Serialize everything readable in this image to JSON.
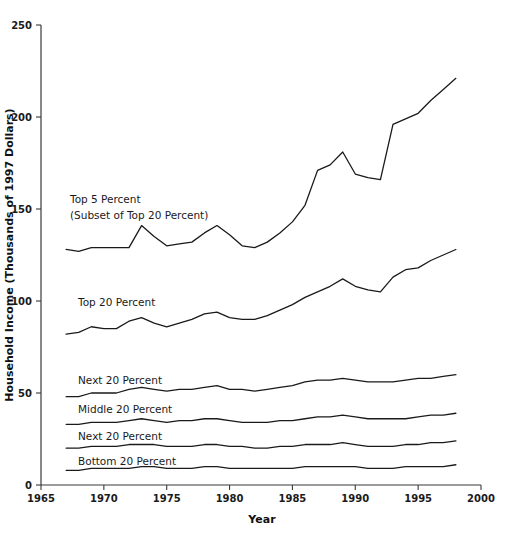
{
  "chart_data": {
    "type": "line",
    "title": "",
    "xlabel": "Year",
    "ylabel": "Household Income (Thousands of 1997 Dollars)",
    "xlim": [
      1965,
      2000
    ],
    "ylim": [
      0,
      250
    ],
    "xticks": [
      1965,
      1970,
      1975,
      1980,
      1985,
      1990,
      1995,
      2000
    ],
    "yticks": [
      0,
      50,
      100,
      150,
      200,
      250
    ],
    "grid": false,
    "legend_position": "inline-labels",
    "x": [
      1967,
      1968,
      1969,
      1970,
      1971,
      1972,
      1973,
      1974,
      1975,
      1976,
      1977,
      1978,
      1979,
      1980,
      1981,
      1982,
      1983,
      1984,
      1985,
      1986,
      1987,
      1988,
      1989,
      1990,
      1991,
      1992,
      1993,
      1994,
      1995,
      1996,
      1997,
      1998
    ],
    "series": [
      {
        "name": "Top 5 Percent",
        "label": "Top 5 Percent",
        "sublabel": "(Subset of Top 20 Percent)",
        "values": [
          128,
          127,
          129,
          129,
          129,
          129,
          141,
          135,
          130,
          131,
          132,
          137,
          141,
          136,
          130,
          129,
          132,
          137,
          143,
          152,
          171,
          174,
          181,
          169,
          167,
          166,
          196,
          199,
          202,
          209,
          215,
          221
        ]
      },
      {
        "name": "Top 20 Percent",
        "label": "Top 20 Percent",
        "values": [
          82,
          83,
          86,
          85,
          85,
          89,
          91,
          88,
          86,
          88,
          90,
          93,
          94,
          91,
          90,
          90,
          92,
          95,
          98,
          102,
          105,
          108,
          112,
          108,
          106,
          105,
          113,
          117,
          118,
          122,
          125,
          128
        ]
      },
      {
        "name": "Next 20 Percent",
        "label": "Next 20 Percent",
        "values": [
          48,
          48,
          50,
          50,
          50,
          52,
          53,
          52,
          51,
          52,
          52,
          53,
          54,
          52,
          52,
          51,
          52,
          53,
          54,
          56,
          57,
          57,
          58,
          57,
          56,
          56,
          56,
          57,
          58,
          58,
          59,
          60
        ]
      },
      {
        "name": "Middle 20 Percent",
        "label": "Middle 20 Percent",
        "values": [
          33,
          33,
          34,
          34,
          34,
          35,
          36,
          35,
          34,
          35,
          35,
          36,
          36,
          35,
          34,
          34,
          34,
          35,
          35,
          36,
          37,
          37,
          38,
          37,
          36,
          36,
          36,
          36,
          37,
          38,
          38,
          39
        ]
      },
      {
        "name": "Next 20 Percent (Second Quintile)",
        "label": "Next 20 Percent",
        "values": [
          20,
          20,
          21,
          21,
          21,
          22,
          22,
          22,
          21,
          21,
          21,
          22,
          22,
          21,
          21,
          20,
          20,
          21,
          21,
          22,
          22,
          22,
          23,
          22,
          21,
          21,
          21,
          22,
          22,
          23,
          23,
          24
        ]
      },
      {
        "name": "Bottom 20 Percent",
        "label": "Bottom 20 Percent",
        "values": [
          8,
          8,
          9,
          9,
          9,
          9,
          10,
          10,
          9,
          9,
          9,
          10,
          10,
          9,
          9,
          9,
          9,
          9,
          9,
          10,
          10,
          10,
          10,
          10,
          9,
          9,
          9,
          10,
          10,
          10,
          10,
          11
        ]
      }
    ],
    "annotations": [
      {
        "name": "top5-label",
        "text": "Top 5 Percent",
        "x": 70,
        "y": 203
      },
      {
        "name": "top5-sublabel",
        "text": "(Subset of Top 20 Percent)",
        "x": 70,
        "y": 219
      },
      {
        "name": "top20-label",
        "text": "Top 20 Percent",
        "x": 78,
        "y": 306
      },
      {
        "name": "next20-label",
        "text": "Next 20 Percent",
        "x": 78,
        "y": 384
      },
      {
        "name": "middle20-label",
        "text": "Middle 20 Percent",
        "x": 78,
        "y": 413
      },
      {
        "name": "second20-label",
        "text": "Next 20 Percent",
        "x": 78,
        "y": 440
      },
      {
        "name": "bottom20-label",
        "text": "Bottom 20 Percent",
        "x": 78,
        "y": 465
      }
    ]
  },
  "axes": {
    "y_title": "Household Income (Thousands of 1997 Dollars)",
    "x_title": "Year",
    "y_tick_labels": [
      "0",
      "50",
      "100",
      "150",
      "200",
      "250"
    ],
    "x_tick_labels": [
      "1965",
      "1970",
      "1975",
      "1980",
      "1985",
      "1990",
      "1995",
      "2000"
    ]
  },
  "colors": {
    "line": "#1a1a1a",
    "axis": "#3a3a3a",
    "background": "#ffffff",
    "text": "#111111"
  }
}
